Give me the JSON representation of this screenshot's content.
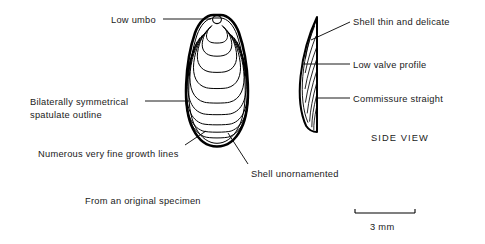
{
  "figure": {
    "kind": "scientific-line-drawing",
    "line_color": "#000000",
    "background_color": "#ffffff"
  },
  "labels": {
    "low_umbo": "Low umbo",
    "bilaterally_symmetrical_line1": "Bilaterally symmetrical",
    "bilaterally_symmetrical_line2": "spatulate outline",
    "growth_lines": "Numerous very fine growth lines",
    "shell_unornamented": "Shell unornamented",
    "shell_thin_and_delicate": "Shell thin and delicate",
    "low_valve_profile": "Low valve profile",
    "commissure_straight": "Commissure straight"
  },
  "view_title": "SIDE VIEW",
  "caption": "From an original specimen",
  "scale_bar": {
    "label": "3 mm"
  }
}
